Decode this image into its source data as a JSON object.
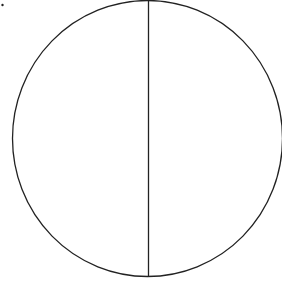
{
  "diagram": {
    "background": "#ffffff",
    "stroke_color": "#222222",
    "stroke_width": 1.3,
    "dot": {
      "cx": 2.5,
      "cy": 5,
      "r": 1.2
    },
    "circle": {
      "cx": 147.5,
      "cy": 138.5,
      "rx": 135,
      "ry": 138
    },
    "divider": {
      "x1": 148.5,
      "y1": 0,
      "x2": 148.5,
      "y2": 277
    }
  }
}
